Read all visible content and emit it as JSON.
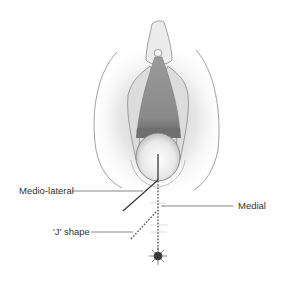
{
  "figure": {
    "type": "anatomical-diagram",
    "labels": {
      "mediolateral": "Medio-lateral",
      "medial": "Medial",
      "j_shape": "'J' shape"
    },
    "colors": {
      "background": "#ffffff",
      "outline": "#8a8a8a",
      "tissue_shade": "#d4d4d4",
      "opening_dark": "#8c8c8c",
      "incision_line": "#3a3a3a",
      "label_text": "#333333"
    },
    "incisions": [
      {
        "name": "Medio-lateral",
        "style": "solid"
      },
      {
        "name": "Medial",
        "style": "dotted"
      },
      {
        "name": "'J' shape",
        "style": "dotted"
      }
    ]
  }
}
